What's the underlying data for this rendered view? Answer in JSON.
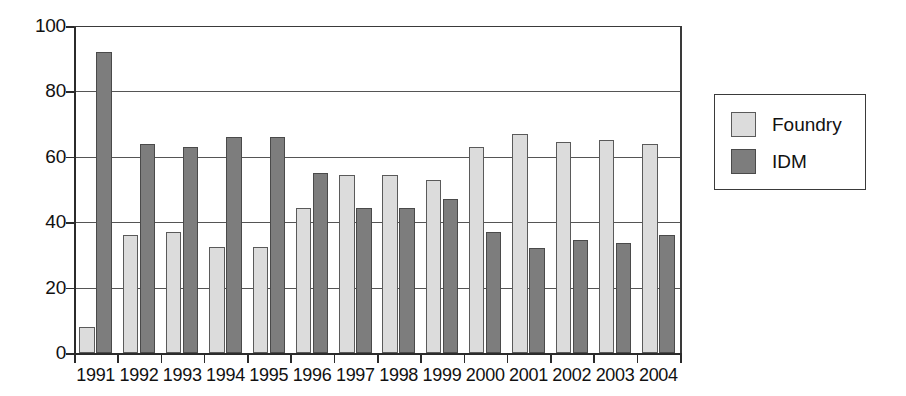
{
  "chart_data": {
    "type": "bar",
    "title": "",
    "subtitle": "",
    "xlabel": "",
    "ylabel": "",
    "categories": [
      "1991",
      "1992",
      "1993",
      "1994",
      "1995",
      "1996",
      "1997",
      "1998",
      "1999",
      "2000",
      "2001",
      "2002",
      "2003",
      "2004"
    ],
    "series": [
      {
        "name": "Foundry",
        "color": "#dcdcdc",
        "values": [
          8,
          36,
          37,
          32.5,
          32.5,
          44.5,
          54.5,
          54.5,
          53,
          63,
          67,
          64.5,
          65,
          64
        ]
      },
      {
        "name": "IDM",
        "color": "#7d7d7d",
        "values": [
          92,
          64,
          63,
          66,
          66,
          55,
          44.5,
          44.5,
          47,
          37,
          32,
          34.5,
          33.5,
          36
        ]
      }
    ],
    "ylim": [
      0,
      100
    ],
    "y_ticks": [
      "0",
      "20",
      "40",
      "60",
      "80",
      "100"
    ],
    "y_tick_values": [
      0,
      20,
      40,
      60,
      80,
      100
    ],
    "grid": true,
    "grid_axis": "y",
    "legend_position": "right",
    "bar_group_style": "grouped"
  },
  "legend": {
    "entries": [
      {
        "label": "Foundry",
        "swatch": "foundry"
      },
      {
        "label": "IDM",
        "swatch": "idm"
      }
    ]
  }
}
